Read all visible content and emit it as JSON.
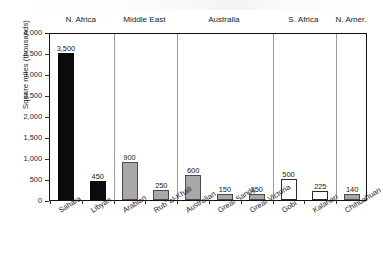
{
  "chart_data": {
    "type": "bar",
    "title": "",
    "xlabel": "",
    "ylabel": "Square miles (thousands)",
    "ylim": [
      0,
      4000
    ],
    "ytick_labels": [
      "4,000",
      "3,500",
      "3,000",
      "2,500",
      "2,000",
      "1,500",
      "1,000",
      "500",
      "0"
    ],
    "ytick_values": [
      4000,
      3500,
      3000,
      2500,
      2000,
      1500,
      1000,
      500,
      0
    ],
    "grid": false,
    "legend": "none",
    "categories": [
      "Sahara",
      "Libyan",
      "Arabian",
      "Rub' al-Khali",
      "Australian",
      "Great Sandy",
      "Great Victoria",
      "Gobi",
      "Kalahari",
      "Chihuahuan"
    ],
    "values": [
      3500,
      450,
      900,
      250,
      600,
      150,
      150,
      500,
      225,
      140
    ],
    "value_labels": [
      "3,500",
      "450",
      "900",
      "250",
      "600",
      "150",
      "150",
      "500",
      "225",
      "140"
    ],
    "bar_styles": [
      "black",
      "black",
      "gray",
      "gray",
      "gray",
      "gray",
      "gray",
      "white",
      "white",
      "gray"
    ],
    "groups": [
      {
        "label": "N. Africa",
        "total": "3,950",
        "members": [
          "Sahara",
          "Libyan"
        ]
      },
      {
        "label": "Middle East",
        "total": "1,150",
        "members": [
          "Arabian",
          "Rub' al-Khali"
        ]
      },
      {
        "label": "Australia",
        "total": "900",
        "members": [
          "Australian",
          "Great Sandy",
          "Great Victoria"
        ]
      },
      {
        "label": "S. Africa",
        "total": "725",
        "members": [
          "Gobi",
          "Kalahari"
        ]
      },
      {
        "label": "N. Amer.",
        "total": "140",
        "members": [
          "Chihuahuan"
        ]
      }
    ],
    "colors": {
      "black_bar": "#0b0b0b",
      "gray_bar": "#a8a8a8",
      "white_bar": "#ffffff",
      "total_chip": "#d2d2d2",
      "axis": "#111111",
      "separator": "#9a9a9a"
    }
  }
}
